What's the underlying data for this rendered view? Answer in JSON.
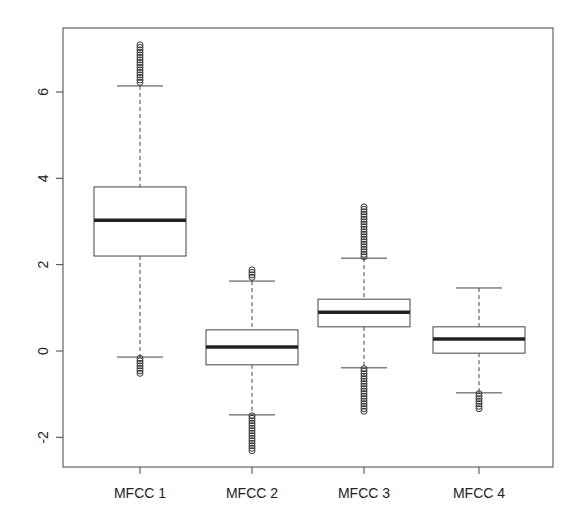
{
  "chart_data": {
    "type": "boxplot",
    "title": "",
    "xlabel": "",
    "ylabel": "",
    "ylim": [
      -2.75,
      7.35
    ],
    "yticks": [
      -2,
      0,
      2,
      4,
      6
    ],
    "ytick_labels": [
      "-2",
      "0",
      "2",
      "4",
      "6"
    ],
    "grid": false,
    "legend": null,
    "categories": [
      "MFCC 1",
      "MFCC 2",
      "MFCC 3",
      "MFCC 4"
    ],
    "series": [
      {
        "name": "MFCC 1",
        "whisker_low": -0.14,
        "q1": 2.2,
        "median": 3.03,
        "q3": 3.8,
        "whisker_high": 6.14,
        "outliers_low_range": [
          -0.55,
          -0.17
        ],
        "outliers_high_range": [
          6.18,
          7.09
        ]
      },
      {
        "name": "MFCC 2",
        "whisker_low": -1.48,
        "q1": -0.32,
        "median": 0.09,
        "q3": 0.49,
        "whisker_high": 1.62,
        "outliers_low_range": [
          -2.34,
          -1.5
        ],
        "outliers_high_range": [
          1.65,
          1.88
        ]
      },
      {
        "name": "MFCC 3",
        "whisker_low": -0.39,
        "q1": 0.56,
        "median": 0.9,
        "q3": 1.2,
        "whisker_high": 2.15,
        "outliers_low_range": [
          -1.44,
          -0.41
        ],
        "outliers_high_range": [
          2.18,
          3.34
        ]
      },
      {
        "name": "MFCC 4",
        "whisker_low": -0.97,
        "q1": -0.05,
        "median": 0.28,
        "q3": 0.56,
        "whisker_high": 1.46,
        "outliers_low_range": [
          -1.39,
          -0.99
        ],
        "outliers_high_range": null
      }
    ]
  }
}
